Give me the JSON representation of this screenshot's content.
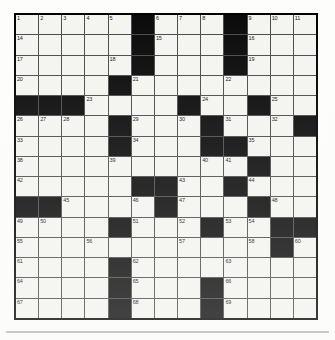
{
  "puzzle": {
    "title": "Crossword Grid",
    "columns": 13,
    "rows": 15,
    "colors": {
      "block": "#090909",
      "cell": "#f4f4f1",
      "grid_line": "#4a4a4a",
      "border": "#000000",
      "page_background": "#fdfdfc",
      "rule": "#b9b9b9",
      "number_text": "#111111"
    },
    "black_squares": [
      [
        1,
        6
      ],
      [
        1,
        10
      ],
      [
        2,
        6
      ],
      [
        2,
        10
      ],
      [
        3,
        6
      ],
      [
        3,
        10
      ],
      [
        4,
        5
      ],
      [
        5,
        1
      ],
      [
        5,
        2
      ],
      [
        5,
        3
      ],
      [
        5,
        8
      ],
      [
        5,
        11
      ],
      [
        6,
        5
      ],
      [
        6,
        9
      ],
      [
        6,
        13
      ],
      [
        7,
        5
      ],
      [
        7,
        9
      ],
      [
        7,
        10
      ],
      [
        8,
        11
      ],
      [
        9,
        6
      ],
      [
        9,
        7
      ],
      [
        9,
        10
      ],
      [
        10,
        1
      ],
      [
        10,
        2
      ],
      [
        10,
        7
      ],
      [
        10,
        11
      ],
      [
        11,
        5
      ],
      [
        11,
        9
      ],
      [
        11,
        12
      ],
      [
        11,
        13
      ],
      [
        12,
        12
      ],
      [
        13,
        5
      ],
      [
        14,
        5
      ],
      [
        14,
        9
      ],
      [
        15,
        5
      ],
      [
        15,
        9
      ]
    ],
    "numbers": [
      {
        "row": 1,
        "col": 1,
        "n": "1"
      },
      {
        "row": 1,
        "col": 2,
        "n": "2"
      },
      {
        "row": 1,
        "col": 3,
        "n": "3"
      },
      {
        "row": 1,
        "col": 4,
        "n": "4"
      },
      {
        "row": 1,
        "col": 5,
        "n": "5"
      },
      {
        "row": 1,
        "col": 7,
        "n": "6"
      },
      {
        "row": 1,
        "col": 8,
        "n": "7"
      },
      {
        "row": 1,
        "col": 9,
        "n": "8"
      },
      {
        "row": 1,
        "col": 11,
        "n": "9"
      },
      {
        "row": 1,
        "col": 12,
        "n": "10"
      },
      {
        "row": 1,
        "col": 13,
        "n": "11"
      },
      {
        "row": 2,
        "col": 1,
        "n": "14"
      },
      {
        "row": 2,
        "col": 7,
        "n": "15"
      },
      {
        "row": 2,
        "col": 11,
        "n": "16"
      },
      {
        "row": 3,
        "col": 1,
        "n": "17"
      },
      {
        "row": 3,
        "col": 5,
        "n": "18"
      },
      {
        "row": 3,
        "col": 11,
        "n": "19"
      },
      {
        "row": 4,
        "col": 1,
        "n": "20"
      },
      {
        "row": 4,
        "col": 6,
        "n": "21"
      },
      {
        "row": 4,
        "col": 10,
        "n": "22"
      },
      {
        "row": 5,
        "col": 4,
        "n": "23"
      },
      {
        "row": 5,
        "col": 9,
        "n": "24"
      },
      {
        "row": 5,
        "col": 12,
        "n": "25"
      },
      {
        "row": 6,
        "col": 1,
        "n": "26"
      },
      {
        "row": 6,
        "col": 2,
        "n": "27"
      },
      {
        "row": 6,
        "col": 3,
        "n": "28"
      },
      {
        "row": 6,
        "col": 6,
        "n": "29"
      },
      {
        "row": 6,
        "col": 8,
        "n": "30"
      },
      {
        "row": 6,
        "col": 10,
        "n": "31"
      },
      {
        "row": 6,
        "col": 12,
        "n": "32"
      },
      {
        "row": 7,
        "col": 1,
        "n": "33"
      },
      {
        "row": 7,
        "col": 6,
        "n": "34"
      },
      {
        "row": 7,
        "col": 11,
        "n": "35"
      },
      {
        "row": 8,
        "col": 1,
        "n": "38"
      },
      {
        "row": 8,
        "col": 5,
        "n": "39"
      },
      {
        "row": 8,
        "col": 9,
        "n": "40"
      },
      {
        "row": 8,
        "col": 10,
        "n": "41"
      },
      {
        "row": 9,
        "col": 1,
        "n": "42"
      },
      {
        "row": 9,
        "col": 8,
        "n": "43"
      },
      {
        "row": 9,
        "col": 11,
        "n": "44"
      },
      {
        "row": 10,
        "col": 3,
        "n": "45"
      },
      {
        "row": 10,
        "col": 6,
        "n": "46"
      },
      {
        "row": 10,
        "col": 8,
        "n": "47"
      },
      {
        "row": 10,
        "col": 12,
        "n": "48"
      },
      {
        "row": 11,
        "col": 1,
        "n": "49"
      },
      {
        "row": 11,
        "col": 2,
        "n": "50"
      },
      {
        "row": 11,
        "col": 6,
        "n": "51"
      },
      {
        "row": 11,
        "col": 8,
        "n": "52"
      },
      {
        "row": 11,
        "col": 10,
        "n": "53"
      },
      {
        "row": 11,
        "col": 11,
        "n": "54"
      },
      {
        "row": 12,
        "col": 1,
        "n": "55"
      },
      {
        "row": 12,
        "col": 4,
        "n": "56"
      },
      {
        "row": 12,
        "col": 8,
        "n": "57"
      },
      {
        "row": 12,
        "col": 11,
        "n": "58"
      },
      {
        "row": 12,
        "col": 12,
        "n": "59"
      },
      {
        "row": 12,
        "col": 13,
        "n": "60"
      },
      {
        "row": 13,
        "col": 1,
        "n": "61"
      },
      {
        "row": 13,
        "col": 6,
        "n": "62"
      },
      {
        "row": 13,
        "col": 10,
        "n": "63"
      },
      {
        "row": 14,
        "col": 1,
        "n": "64"
      },
      {
        "row": 14,
        "col": 6,
        "n": "65"
      },
      {
        "row": 14,
        "col": 10,
        "n": "66"
      },
      {
        "row": 15,
        "col": 1,
        "n": "67"
      },
      {
        "row": 15,
        "col": 6,
        "n": "68"
      },
      {
        "row": 15,
        "col": 10,
        "n": "69"
      }
    ],
    "extra_numbers": [
      {
        "row": 1,
        "col": 6,
        "n": "6"
      },
      {
        "row": 1,
        "col": 10,
        "n": "9"
      },
      {
        "row": 6,
        "col": 13,
        "n": "13"
      },
      {
        "row": 7,
        "col": 12,
        "n": "36"
      },
      {
        "row": 7,
        "col": 13,
        "n": "37"
      }
    ]
  }
}
